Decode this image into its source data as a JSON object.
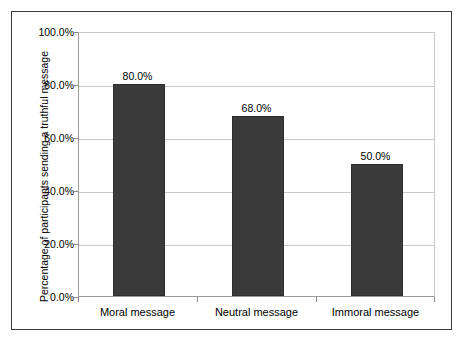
{
  "chart_data": {
    "type": "bar",
    "title": "",
    "subtitle": "",
    "xlabel": "",
    "ylabel": "Percentage of participants sending a truthful message",
    "categories": [
      "Moral message",
      "Neutral message",
      "Immoral message"
    ],
    "values": [
      80.0,
      68.0,
      50.0
    ],
    "value_labels": [
      "80.0%",
      "68.0%",
      "50.0%"
    ],
    "ylim": [
      0,
      100
    ],
    "ytick_values": [
      0,
      20,
      40,
      60,
      80,
      100
    ],
    "ytick_labels": [
      "0.0%",
      "20.0%",
      "40.0%",
      "60.0%",
      "80.0%",
      "100.0%"
    ],
    "grid": "horizontal",
    "legend": "none",
    "bar_color": "#3a3a3a",
    "gridline_color": "#c9c9c9",
    "axis_color": "#8a8a8a",
    "frame_color": "#3b3b3b",
    "background_color": "#ffffff"
  }
}
